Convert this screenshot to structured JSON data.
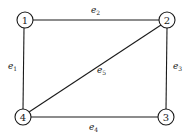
{
  "diagram": {
    "type": "graph",
    "nodes": [
      {
        "id": "1",
        "label": "1",
        "x": 25,
        "y": 20
      },
      {
        "id": "2",
        "label": "2",
        "x": 167,
        "y": 20
      },
      {
        "id": "3",
        "label": "3",
        "x": 166,
        "y": 117
      },
      {
        "id": "4",
        "label": "4",
        "x": 23,
        "y": 117
      }
    ],
    "edges": [
      {
        "id": "e1",
        "base": "e",
        "sub": "1",
        "from": "1",
        "to": "4"
      },
      {
        "id": "e2",
        "base": "e",
        "sub": "2",
        "from": "1",
        "to": "2"
      },
      {
        "id": "e3",
        "base": "e",
        "sub": "3",
        "from": "2",
        "to": "3"
      },
      {
        "id": "e4",
        "base": "e",
        "sub": "4",
        "from": "4",
        "to": "3"
      },
      {
        "id": "e5",
        "base": "e",
        "sub": "5",
        "from": "4",
        "to": "2"
      }
    ]
  }
}
